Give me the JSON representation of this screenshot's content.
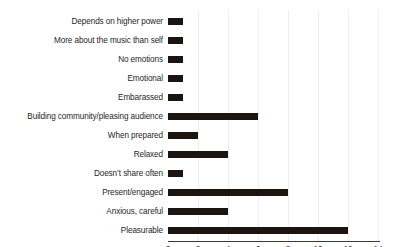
{
  "chart_data": {
    "type": "bar",
    "orientation": "horizontal",
    "title": "",
    "xlabel": "",
    "ylabel": "",
    "xlim": [
      0,
      14
    ],
    "xticks": [
      0,
      2,
      4,
      6,
      8,
      10,
      12,
      14
    ],
    "grid": true,
    "legend": false,
    "bar_color": "#1c1410",
    "categories": [
      "Depends on higher power",
      "More about the music than self",
      "No emotions",
      "Emotional",
      "Embarassed",
      "Building community/pleasing audience",
      "When prepared",
      "Relaxed",
      "Doesn’t share often",
      "Present/engaged",
      "Anxious, careful",
      "Pleasurable"
    ],
    "values": [
      1,
      1,
      1,
      1,
      1,
      6,
      2,
      4,
      1,
      8,
      4,
      12
    ]
  }
}
